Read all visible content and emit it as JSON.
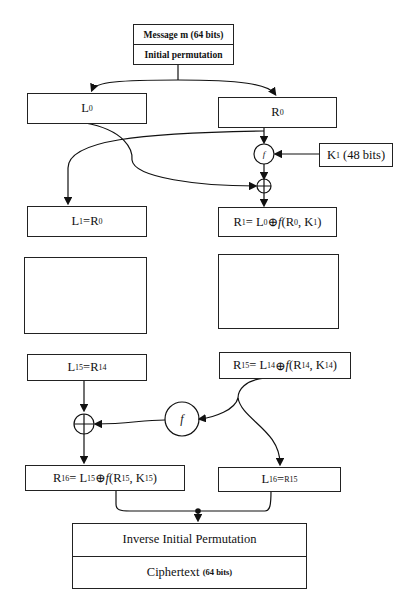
{
  "diagram": {
    "input": {
      "message_label": "Message m (64 bits)",
      "initial_permutation_label": "Initial permutation"
    },
    "round0": {
      "left": {
        "base": "L",
        "sub": "0"
      },
      "right": {
        "base": "R",
        "sub": "0"
      }
    },
    "key1": {
      "base": "K",
      "sub": "1",
      "suffix": "(48 bits)"
    },
    "function_label": "f",
    "xor_symbol": "⊕",
    "round1": {
      "left": {
        "text_a": "L",
        "sub_a": "1",
        "eq": " = ",
        "text_b": "R",
        "sub_b": "0"
      },
      "right": {
        "text_a": "R",
        "sub_a": "1",
        "eq": " = L",
        "sub_l": "0",
        "op": " ⊕ ",
        "f": "f",
        "args_open": "(R",
        "sub_r": "0",
        "comma": ", K",
        "sub_k": "1",
        "close": ")"
      }
    },
    "ellipsis": {
      "dots": "⋮"
    },
    "round15": {
      "left": {
        "text_a": "L",
        "sub_a": "15",
        "eq": " = ",
        "text_b": "R",
        "sub_b": "14"
      },
      "right": {
        "text_a": "R",
        "sub_a": "15",
        "eq": " = L",
        "sub_l": "14",
        "op": " ⊕ ",
        "f": "f",
        "args_open": "(R",
        "sub_r": "14",
        "comma": ", K",
        "sub_k": "14",
        "close": ")"
      }
    },
    "round16": {
      "left": {
        "text_a": "R",
        "sub_a": "16",
        "eq": " = L",
        "sub_l": "15",
        "op": " ⊕ ",
        "f": "f",
        "args_open": "(R",
        "sub_r": "15",
        "comma": ", K",
        "sub_k": "15",
        "close": ")"
      },
      "right": {
        "text_a": "L",
        "sub_a": "16",
        "eq": " = ",
        "text_b": "R15"
      }
    },
    "output": {
      "inverse_permutation_label": "Inverse Initial Permutation",
      "ciphertext_label": "Ciphertext",
      "ciphertext_bits": "(64 bits)"
    }
  }
}
